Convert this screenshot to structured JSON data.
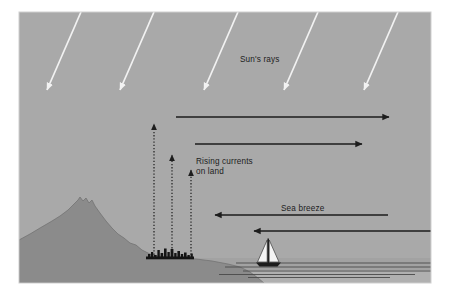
{
  "figure": {
    "frame": {
      "x": 19,
      "y": 12,
      "width": 412,
      "height": 271
    },
    "colors": {
      "page_background": "#ffffff",
      "sky": "#a9a9a9",
      "land": "#8b8b8b",
      "sea": "#a2a2a2",
      "sea_highlight": "#b4b4b4",
      "ink": "#1d1d1d",
      "sun_ray": "#f2f2f2",
      "sail": "#f4f4f4",
      "city": "#1a1a1a"
    }
  },
  "labels": {
    "suns_rays": "Sun's rays",
    "rising_currents_line1": "Rising currents",
    "rising_currents_line2": "on land",
    "sea_breeze": "Sea breeze"
  },
  "diagram_data": {
    "type": "diagram",
    "subject": "Sea breeze formation during daytime heating",
    "sun_rays": {
      "icon": "sun-ray-arrow-icon",
      "count": 5,
      "color": "#f2f2f2",
      "direction": "down-right",
      "angle_deg_from_horizontal": 58,
      "arrows": [
        {
          "x1": 81,
          "y1": 12,
          "x2": 46,
          "y2": 92
        },
        {
          "x1": 154,
          "y1": 12,
          "x2": 120,
          "y2": 92
        },
        {
          "x1": 238,
          "y1": 12,
          "x2": 204,
          "y2": 92
        },
        {
          "x1": 318,
          "y1": 12,
          "x2": 284,
          "y2": 92
        },
        {
          "x1": 398,
          "y1": 12,
          "x2": 364,
          "y2": 92
        }
      ]
    },
    "upper_return_flow": {
      "icon": "right-arrow-icon",
      "description": "Upper level return flow toward the sea",
      "color": "#1d1d1d",
      "direction": "right",
      "arrows": [
        {
          "x1": 176,
          "y1": 117,
          "x2": 391,
          "y2": 117
        },
        {
          "x1": 195,
          "y1": 144,
          "x2": 364,
          "y2": 144
        }
      ]
    },
    "rising_currents": {
      "icon": "up-arrow-dashed-icon",
      "description": "Rising warm air currents over heated land",
      "color": "#1d1d1d",
      "direction": "up",
      "style": "dotted",
      "arrows": [
        {
          "x": 154,
          "y_base": 258,
          "y_tip": 122,
          "height": 136
        },
        {
          "x": 172,
          "y_base": 258,
          "y_tip": 153,
          "height": 105
        },
        {
          "x": 191,
          "y_base": 258,
          "y_tip": 168,
          "height": 90
        }
      ]
    },
    "sea_breeze_flow": {
      "icon": "left-arrow-icon",
      "description": "Cool surface air flowing from sea to land",
      "color": "#1d1d1d",
      "direction": "left",
      "arrows": [
        {
          "x1": 388,
          "y1": 215,
          "x2": 213,
          "y2": 215
        },
        {
          "x1": 431,
          "y1": 231,
          "x2": 252,
          "y2": 231
        }
      ]
    },
    "terrain": {
      "icon": "mountain-icon",
      "description": "Coastal mountain ridge sloping down to the shore",
      "peak": {
        "x": 80,
        "y": 198
      },
      "shoreline_x": 237
    },
    "city": {
      "icon": "city-skyline-icon",
      "description": "Small coastal town at the foot of the slope",
      "x": 148,
      "y": 257,
      "width": 44
    },
    "sailboat": {
      "icon": "sailboat-icon",
      "description": "Sailboat on the sea",
      "x": 268,
      "y": 256,
      "mast_height": 24
    },
    "water_lines": {
      "icon": "water-line-icon",
      "count": 5,
      "lines": [
        {
          "x1": 236,
          "y1": 263,
          "x2": 431,
          "y2": 263
        },
        {
          "x1": 225,
          "y1": 267,
          "x2": 431,
          "y2": 267
        },
        {
          "x1": 243,
          "y1": 271,
          "x2": 431,
          "y2": 271
        },
        {
          "x1": 219,
          "y1": 274,
          "x2": 415,
          "y2": 274
        },
        {
          "x1": 248,
          "y1": 277,
          "x2": 390,
          "y2": 277
        }
      ]
    },
    "label_positions": {
      "suns_rays": {
        "x": 240,
        "y": 62
      },
      "rising_currents": {
        "x": 196,
        "y": 164
      },
      "sea_breeze": {
        "x": 281,
        "y": 211
      }
    }
  }
}
